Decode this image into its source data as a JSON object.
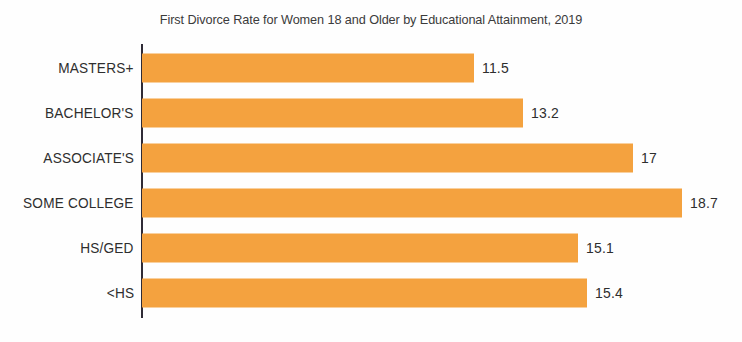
{
  "chart_data": {
    "type": "bar",
    "orientation": "horizontal",
    "title": "First Divorce Rate for Women 18 and Older by Educational Attainment, 2019",
    "xlabel": "",
    "ylabel": "",
    "categories": [
      "MASTERS+",
      "BACHELOR'S",
      "ASSOCIATE'S",
      "SOME COLLEGE",
      "HS/GED",
      "<HS"
    ],
    "values": [
      11.5,
      13.2,
      17,
      18.7,
      15.1,
      15.4
    ],
    "value_labels": [
      "11.5",
      "13.2",
      "17",
      "18.7",
      "15.1",
      "15.4"
    ],
    "xlim": [
      0,
      19.5
    ],
    "grid": false,
    "legend": false,
    "bar_color": "#f4a23f",
    "axis_color": "#2f2b36",
    "text_color": "#2e2e2e",
    "background": "#fefefe"
  }
}
